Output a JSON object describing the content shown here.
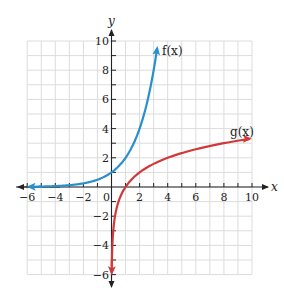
{
  "chart_data": {
    "type": "line",
    "title": "",
    "xlabel": "x",
    "ylabel": "y",
    "xlim": [
      -6,
      10
    ],
    "ylim": [
      -6,
      10
    ],
    "grid": true,
    "x_ticks": [
      -6,
      -4,
      -2,
      0,
      2,
      4,
      6,
      8,
      10
    ],
    "x_tick_labels": [
      "−6",
      "−4",
      "−2",
      "0",
      "2",
      "4",
      "6",
      "8",
      "10"
    ],
    "y_ticks": [
      -6,
      -4,
      -2,
      2,
      4,
      6,
      8,
      10
    ],
    "y_tick_labels": [
      "−6",
      "−4",
      "−2",
      "2",
      "4",
      "6",
      "8",
      "10"
    ],
    "series": [
      {
        "name": "f(x)",
        "color": "#2a8fcf",
        "formula": "2^x",
        "x": [
          -6,
          -4,
          -2,
          -1,
          0,
          1,
          2,
          3,
          3.32
        ],
        "values": [
          0.016,
          0.06,
          0.25,
          0.5,
          1,
          2,
          4,
          8,
          10
        ]
      },
      {
        "name": "g(x)",
        "color": "#d0393a",
        "formula": "log2(x)",
        "x": [
          0.016,
          0.06,
          0.25,
          0.5,
          1,
          2,
          4,
          8,
          10
        ],
        "values": [
          -6,
          -4,
          -2,
          -1,
          0,
          1,
          2,
          3,
          3.32
        ]
      }
    ],
    "legend": {
      "position": "inline-labels",
      "entries": [
        "f(x)",
        "g(x)"
      ]
    }
  },
  "labels": {
    "x_axis": "x",
    "y_axis": "y",
    "f_label": "f(x)",
    "g_label": "g(x)",
    "x_ticks": [
      "−6",
      "−4",
      "−2",
      "0",
      "2",
      "4",
      "6",
      "8",
      "10"
    ],
    "y_ticks": [
      "10",
      "8",
      "6",
      "4",
      "2",
      "−2",
      "−4",
      "−6"
    ]
  },
  "colors": {
    "f": "#2a8fcf",
    "g": "#d0393a",
    "axis": "#222222",
    "grid": "#d9d9d9"
  }
}
